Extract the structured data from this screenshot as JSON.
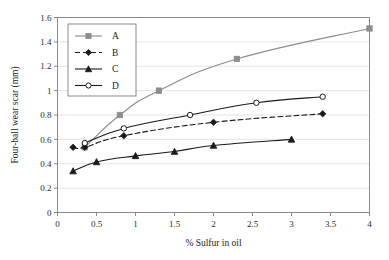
{
  "chart_data": {
    "type": "line",
    "title": "",
    "xlabel": "% Sulfur in oil",
    "ylabel": "Four-ball wear scar (mm)",
    "xlim": [
      0,
      4
    ],
    "ylim": [
      0,
      1.6
    ],
    "xticks": [
      "0",
      "0.5",
      "1",
      "1.5",
      "2",
      "2.5",
      "3",
      "3.5",
      "4"
    ],
    "xtick_values": [
      0,
      0.5,
      1,
      1.5,
      2,
      2.5,
      3,
      3.5,
      4
    ],
    "yticks": [
      "0",
      "0.2",
      "0.4",
      "0.6",
      "0.8",
      "1",
      "1.2",
      "1.4",
      "1.6"
    ],
    "ytick_values": [
      0,
      0.2,
      0.4,
      0.6,
      0.8,
      1.0,
      1.2,
      1.4,
      1.6
    ],
    "grid": "horizontal",
    "legend_position": "upper-left-inside",
    "series": [
      {
        "name": "A",
        "marker": "square",
        "linestyle": "solid",
        "color": "#8c8c8c",
        "marker_color": "#8c8c8c",
        "x": [
          0.35,
          0.8,
          1.3,
          2.3,
          4.0
        ],
        "y": [
          0.535,
          0.8,
          1.0,
          1.26,
          1.51
        ]
      },
      {
        "name": "B",
        "marker": "diamond",
        "linestyle": "dashed",
        "color": "#1a1a1a",
        "marker_color": "#1a1a1a",
        "x": [
          0.2,
          0.35,
          0.85,
          2.0,
          3.4
        ],
        "y": [
          0.535,
          0.535,
          0.63,
          0.74,
          0.81
        ]
      },
      {
        "name": "C",
        "marker": "triangle",
        "linestyle": "solid",
        "color": "#1a1a1a",
        "marker_color": "#1a1a1a",
        "x": [
          0.2,
          0.5,
          1.0,
          1.5,
          2.0,
          3.0
        ],
        "y": [
          0.34,
          0.415,
          0.465,
          0.5,
          0.55,
          0.6
        ]
      },
      {
        "name": "D",
        "marker": "open-circle",
        "linestyle": "solid",
        "color": "#1a1a1a",
        "marker_color": "#ffffff",
        "x": [
          0.35,
          0.85,
          1.7,
          2.55,
          3.4
        ],
        "y": [
          0.57,
          0.69,
          0.8,
          0.9,
          0.95
        ]
      }
    ]
  },
  "legend": {
    "entries": [
      {
        "label": "A"
      },
      {
        "label": "B"
      },
      {
        "label": "C"
      },
      {
        "label": "D"
      }
    ]
  },
  "colors": {
    "series_a": "#8c8c8c",
    "series_b": "#1a1a1a",
    "series_c": "#1a1a1a",
    "series_d": "#1a1a1a",
    "grid": "#d8d8d8",
    "axis": "#7d7d7d",
    "background": "#ffffff"
  }
}
